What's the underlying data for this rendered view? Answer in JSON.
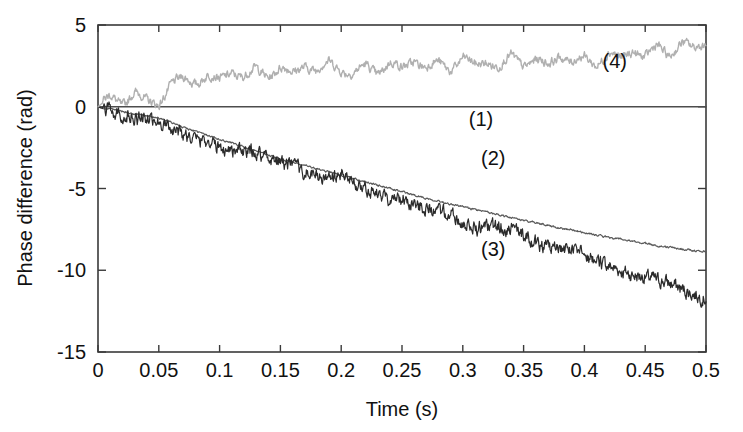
{
  "chart_data": {
    "type": "line",
    "title": "",
    "xlabel": "Time (s)",
    "ylabel": "Phase difference (rad)",
    "xlim": [
      0,
      0.5
    ],
    "ylim": [
      -15,
      5
    ],
    "grid": false,
    "legend_position": "inline-annotations",
    "xticks": [
      0,
      0.05,
      0.1,
      0.15,
      0.2,
      0.25,
      0.3,
      0.35,
      0.4,
      0.45,
      0.5
    ],
    "xticklabels": [
      "0",
      "0.05",
      "0.1",
      "0.15",
      "0.2",
      "0.25",
      "0.3",
      "0.35",
      "0.4",
      "0.45",
      "0.5"
    ],
    "yticks": [
      5,
      0,
      -5,
      -10,
      -15
    ],
    "yticklabels": [
      "5",
      "0",
      "-5",
      "-10",
      "-15"
    ],
    "series": [
      {
        "name": "(1)",
        "label": "(1)",
        "color": "#4d4d4d",
        "annotation": {
          "x": 0.315,
          "y": -1.15
        },
        "description": "flat reference line at zero",
        "x": [
          0,
          0.05,
          0.1,
          0.15,
          0.2,
          0.25,
          0.3,
          0.35,
          0.4,
          0.45,
          0.5
        ],
        "values": [
          0,
          0,
          0,
          0,
          0,
          0,
          0,
          0,
          0,
          0,
          0
        ]
      },
      {
        "name": "(2)",
        "label": "(2)",
        "color": "#5a5a5a",
        "annotation": {
          "x": 0.325,
          "y": -3.55
        },
        "description": "smooth monotonic drift, gently decreasing",
        "x": [
          0,
          0.01,
          0.02,
          0.03,
          0.04,
          0.05,
          0.06,
          0.07,
          0.08,
          0.09,
          0.1,
          0.11,
          0.12,
          0.13,
          0.14,
          0.15,
          0.16,
          0.17,
          0.18,
          0.19,
          0.2,
          0.21,
          0.22,
          0.23,
          0.24,
          0.25,
          0.26,
          0.27,
          0.28,
          0.29,
          0.3,
          0.31,
          0.32,
          0.33,
          0.34,
          0.35,
          0.36,
          0.37,
          0.38,
          0.39,
          0.4,
          0.41,
          0.42,
          0.43,
          0.44,
          0.45,
          0.46,
          0.47,
          0.48,
          0.49,
          0.5
        ],
        "values": [
          0,
          -0.15,
          -0.3,
          -0.45,
          -0.55,
          -0.7,
          -0.95,
          -1.25,
          -1.5,
          -1.75,
          -2.0,
          -2.2,
          -2.45,
          -2.7,
          -2.95,
          -3.2,
          -3.4,
          -3.6,
          -3.8,
          -4.0,
          -4.2,
          -4.4,
          -4.6,
          -4.8,
          -5.0,
          -5.2,
          -5.4,
          -5.6,
          -5.75,
          -5.95,
          -6.1,
          -6.3,
          -6.45,
          -6.6,
          -6.8,
          -6.95,
          -7.1,
          -7.25,
          -7.4,
          -7.55,
          -7.7,
          -7.85,
          -8.0,
          -8.1,
          -8.25,
          -8.35,
          -8.5,
          -8.6,
          -8.7,
          -8.8,
          -8.85
        ]
      },
      {
        "name": "(3)",
        "label": "(3)",
        "color": "#2b2b2b",
        "annotation": {
          "x": 0.325,
          "y": -9.1
        },
        "description": "noisy descending trace, steepest drift",
        "x": [
          0,
          0.01,
          0.02,
          0.03,
          0.04,
          0.05,
          0.06,
          0.07,
          0.08,
          0.09,
          0.1,
          0.11,
          0.12,
          0.13,
          0.14,
          0.15,
          0.16,
          0.17,
          0.18,
          0.19,
          0.2,
          0.21,
          0.22,
          0.23,
          0.24,
          0.25,
          0.26,
          0.27,
          0.28,
          0.29,
          0.3,
          0.31,
          0.32,
          0.33,
          0.34,
          0.35,
          0.36,
          0.37,
          0.38,
          0.39,
          0.4,
          0.41,
          0.42,
          0.43,
          0.44,
          0.45,
          0.46,
          0.47,
          0.48,
          0.49,
          0.5
        ],
        "values": [
          0,
          -0.3,
          -0.5,
          -0.6,
          -0.7,
          -0.85,
          -1.3,
          -1.8,
          -2.1,
          -2.0,
          -2.4,
          -2.5,
          -2.8,
          -2.9,
          -3.2,
          -3.4,
          -3.6,
          -3.9,
          -4.2,
          -4.5,
          -4.3,
          -4.7,
          -5.0,
          -5.3,
          -5.5,
          -5.6,
          -6.0,
          -6.3,
          -6.5,
          -6.6,
          -7.0,
          -7.3,
          -7.5,
          -7.4,
          -7.6,
          -7.9,
          -8.2,
          -8.5,
          -8.7,
          -8.8,
          -9.2,
          -9.5,
          -9.7,
          -9.9,
          -10.2,
          -10.4,
          -10.7,
          -10.9,
          -11.2,
          -11.4,
          -11.6
        ]
      },
      {
        "name": "(4)",
        "label": "(4)",
        "color": "#b0b0b0",
        "annotation": {
          "x": 0.425,
          "y": 2.35
        },
        "description": "oscillating light-gray trace rising above zero",
        "x": [
          0,
          0.01,
          0.02,
          0.03,
          0.04,
          0.05,
          0.06,
          0.07,
          0.08,
          0.09,
          0.1,
          0.11,
          0.12,
          0.13,
          0.14,
          0.15,
          0.16,
          0.17,
          0.18,
          0.19,
          0.2,
          0.21,
          0.22,
          0.23,
          0.24,
          0.25,
          0.26,
          0.27,
          0.28,
          0.29,
          0.3,
          0.31,
          0.32,
          0.33,
          0.34,
          0.35,
          0.36,
          0.37,
          0.38,
          0.39,
          0.4,
          0.41,
          0.42,
          0.43,
          0.44,
          0.45,
          0.46,
          0.47,
          0.48,
          0.49,
          0.5
        ],
        "values": [
          0,
          0.6,
          0.2,
          0.9,
          0.3,
          0.2,
          1.4,
          1.7,
          1.5,
          1.9,
          1.6,
          2.2,
          1.8,
          2.3,
          1.9,
          2.4,
          2.0,
          2.6,
          2.2,
          2.7,
          2.3,
          2.0,
          2.5,
          2.1,
          2.7,
          2.3,
          2.9,
          2.4,
          2.7,
          2.3,
          3.0,
          2.5,
          2.8,
          2.4,
          3.1,
          2.6,
          2.9,
          2.5,
          3.2,
          2.7,
          3.0,
          2.6,
          3.3,
          2.9,
          3.5,
          3.0,
          3.7,
          3.2,
          3.9,
          3.5,
          4.0
        ]
      }
    ]
  }
}
